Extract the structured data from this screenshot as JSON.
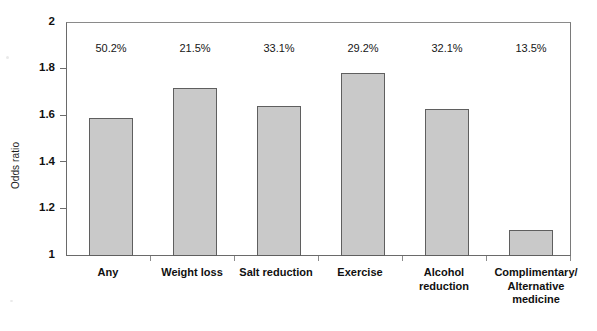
{
  "chart_data": {
    "type": "bar",
    "title": "",
    "subtitle": "",
    "xlabel": "",
    "ylabel": "Odds ratio",
    "ylim": [
      1,
      2
    ],
    "yticks": [
      "1",
      "1.2",
      "1.4",
      "1.6",
      "1.8",
      "2"
    ],
    "ytick_values": [
      1,
      1.2,
      1.4,
      1.6,
      1.8,
      2
    ],
    "grid": false,
    "legend": null,
    "categories": [
      "Any",
      "Weight loss",
      "Salt reduction",
      "Exercise",
      "Alcohol reduction",
      "Complimentary/ Alternative medicine"
    ],
    "category_lines": [
      [
        "Any"
      ],
      [
        "Weight loss"
      ],
      [
        "Salt reduction"
      ],
      [
        "Exercise"
      ],
      [
        "Alcohol",
        "reduction"
      ],
      [
        "Complimentary/",
        "Alternative",
        "medicine"
      ]
    ],
    "values": [
      1.59,
      1.72,
      1.64,
      1.78,
      1.63,
      1.11
    ],
    "data_labels": [
      "50.2%",
      "21.5%",
      "33.1%",
      "29.2%",
      "32.1%",
      "13.5%"
    ],
    "bar_fill_color": "#c9c9c9",
    "bar_edge_color": "#5f5f5f",
    "axis_color": "#6a6a6a",
    "text_color": "#111111"
  },
  "axis": {
    "y_title": "Odds ratio",
    "y_ticks": [
      {
        "label": "2",
        "value": 2
      },
      {
        "label": "1.8",
        "value": 1.8
      },
      {
        "label": "1.6",
        "value": 1.6
      },
      {
        "label": "1.4",
        "value": 1.4
      },
      {
        "label": "1.2",
        "value": 1.2
      },
      {
        "label": "1",
        "value": 1
      }
    ]
  }
}
